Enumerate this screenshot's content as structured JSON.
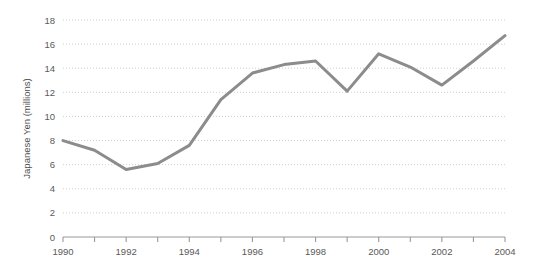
{
  "chart_data": {
    "type": "line",
    "title": "",
    "subtitle": "",
    "xlabel": "",
    "ylabel": "Japanese Yen (millions)",
    "x": [
      1990,
      1991,
      1992,
      1993,
      1994,
      1995,
      1996,
      1997,
      1998,
      1999,
      2000,
      2001,
      2002,
      2003,
      2004
    ],
    "values": [
      8.0,
      7.2,
      5.6,
      6.1,
      7.6,
      11.4,
      13.6,
      14.3,
      14.6,
      12.1,
      15.2,
      14.1,
      12.6,
      14.6,
      16.7
    ],
    "series": [
      {
        "name": "Japanese Yen (millions)",
        "values": [
          8.0,
          7.2,
          5.6,
          6.1,
          7.6,
          11.4,
          13.6,
          14.3,
          14.6,
          12.1,
          15.2,
          14.1,
          12.6,
          14.6,
          16.7
        ],
        "color": "#8c8c8c"
      }
    ],
    "xlim": [
      1990,
      2004
    ],
    "ylim": [
      0,
      18
    ],
    "y_ticks": [
      0,
      2,
      4,
      6,
      8,
      10,
      12,
      14,
      16,
      18
    ],
    "y_tick_labels": [
      "0",
      "2",
      "4",
      "6",
      "8",
      "10",
      "12",
      "14",
      "16",
      "18"
    ],
    "x_ticks": [
      1990,
      1991,
      1992,
      1993,
      1994,
      1995,
      1996,
      1997,
      1998,
      1999,
      2000,
      2001,
      2002,
      2003,
      2004
    ],
    "x_tick_labels": [
      "1990",
      "",
      "1992",
      "",
      "1994",
      "",
      "1996",
      "",
      "1998",
      "",
      "2000",
      "",
      "2002",
      "",
      "2004"
    ],
    "x_labeled_ticks": [
      1990,
      1992,
      1994,
      1996,
      1998,
      2000,
      2002,
      2004
    ],
    "grid": true,
    "grid_style": "dotted-horizontal",
    "legend": false,
    "legend_position": "none",
    "colors": {
      "line": "#8c8c8c",
      "grid": "#cfcfcf",
      "axis": "#999999",
      "tick_text": "#595959",
      "axis_title": "#4d4d4d",
      "background": "#ffffff"
    },
    "line_width": 3
  }
}
